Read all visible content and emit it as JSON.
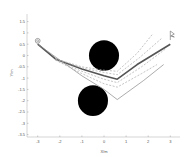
{
  "chart_data": {
    "type": "line",
    "title": "",
    "xlabel": "X/m",
    "ylabel": "Y/m",
    "xlim": [
      -3.5,
      3.5
    ],
    "ylim": [
      -3.6,
      1.7
    ],
    "x_ticks": [
      "-3",
      "-2",
      "-1",
      "0",
      "1",
      "2",
      "3"
    ],
    "y_ticks": [
      "1.5",
      "1",
      "0.5",
      "0",
      "-0.5",
      "-1",
      "-1.5",
      "-2",
      "-2.5",
      "-3",
      "-3.5"
    ],
    "grid": false,
    "start": {
      "x": -3,
      "y": 0.65,
      "marker": "circle"
    },
    "goal": {
      "x": 3,
      "y": 0.95,
      "marker": "flag"
    },
    "obstacles": [
      {
        "cx": 0,
        "cy": 0,
        "r": 0.68
      },
      {
        "cx": -0.5,
        "cy": -2,
        "r": 0.68
      }
    ],
    "series": [
      {
        "name": "main-path",
        "style": "solid-thick",
        "color": "#555555",
        "x": [
          -3,
          -2.2,
          -1,
          0,
          0.6,
          1.5,
          3
        ],
        "y": [
          0.5,
          -0.15,
          -0.6,
          -0.9,
          -1.05,
          -0.4,
          0.5
        ]
      },
      {
        "name": "path-thin-low",
        "style": "solid",
        "color": "#888888",
        "x": [
          -3,
          -2,
          -1,
          0,
          0.6,
          1.8,
          2.7
        ],
        "y": [
          0.5,
          -0.2,
          -0.9,
          -1.5,
          -1.95,
          -1.1,
          -0.4
        ]
      },
      {
        "name": "dashed-1",
        "style": "dashed",
        "color": "#aaaaaa",
        "x": [
          -2.2,
          -1,
          0,
          0.6,
          1.5,
          2.2
        ],
        "y": [
          -0.15,
          -0.5,
          -0.65,
          -0.7,
          0.1,
          0.95
        ]
      },
      {
        "name": "dashed-2",
        "style": "dashed",
        "color": "#aaaaaa",
        "x": [
          -2.2,
          -1,
          0,
          0.6,
          1.6,
          2.6
        ],
        "y": [
          -0.15,
          -0.55,
          -0.75,
          -0.85,
          -0.1,
          0.75
        ]
      },
      {
        "name": "dashed-3",
        "style": "dashed",
        "color": "#aaaaaa",
        "x": [
          -2.2,
          -1,
          0,
          0.6,
          1.7,
          2.8
        ],
        "y": [
          -0.2,
          -0.7,
          -1.05,
          -1.2,
          -0.5,
          0.3
        ]
      },
      {
        "name": "dashed-4",
        "style": "dashed",
        "color": "#aaaaaa",
        "x": [
          -2.2,
          -1,
          0,
          0.6,
          1.7,
          2.4
        ],
        "y": [
          -0.2,
          -0.8,
          -1.25,
          -1.4,
          -0.8,
          -0.4
        ]
      }
    ]
  }
}
